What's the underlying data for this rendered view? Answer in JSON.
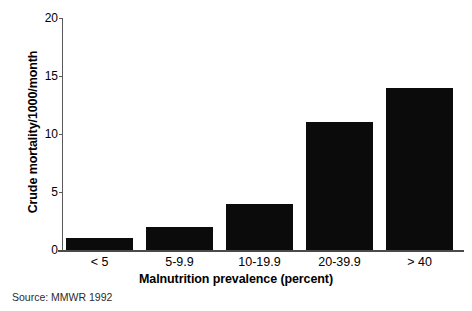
{
  "chart_data": {
    "type": "bar",
    "title": "",
    "xlabel": "Malnutrition prevalence (percent)",
    "ylabel": "Crude mortality/1000/month",
    "categories": [
      "< 5",
      "5-9.9",
      "10-19.9",
      "20-39.9",
      "> 40"
    ],
    "values": [
      1,
      2,
      4,
      11,
      14
    ],
    "ylim": [
      0,
      20
    ],
    "yticks": [
      0,
      5,
      10,
      15,
      20
    ],
    "ytick_labels": [
      "0",
      "5",
      "10",
      "15",
      "20"
    ],
    "grid": false,
    "legend": null,
    "bar_color": "#0b0b0b",
    "series": [
      {
        "name": "Crude mortality/1000/month",
        "values": [
          1,
          2,
          4,
          11,
          14
        ]
      }
    ]
  },
  "annotations": {
    "source": "Source: MMWR 1992"
  }
}
